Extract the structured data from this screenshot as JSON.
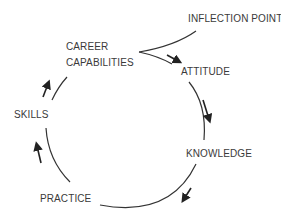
{
  "diagram": {
    "type": "cycle",
    "entry": "INFLECTION POINT",
    "nodes": [
      {
        "id": "career",
        "label_line1": "CAREER",
        "label_line2": "CAPABILITIES"
      },
      {
        "id": "attitude",
        "label": "ATTITUDE"
      },
      {
        "id": "knowledge",
        "label": "KNOWLEDGE"
      },
      {
        "id": "practice",
        "label": "PRACTICE"
      },
      {
        "id": "skills",
        "label": "SKILLS"
      }
    ],
    "cycle_order": [
      "CAREER CAPABILITIES",
      "ATTITUDE",
      "KNOWLEDGE",
      "PRACTICE",
      "SKILLS",
      "CAREER CAPABILITIES"
    ],
    "direction": "clockwise",
    "line_color": "#333333",
    "text_color": "#3a3a3a"
  }
}
